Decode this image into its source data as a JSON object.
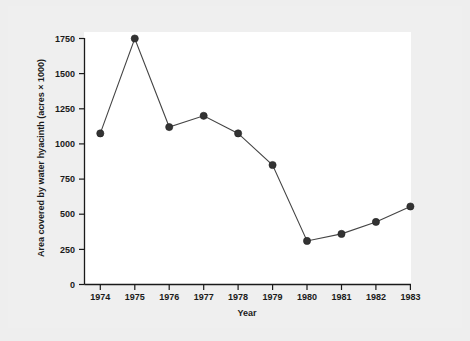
{
  "chart_data": {
    "type": "line",
    "title": "",
    "subtitle": "",
    "xlabel": "Year",
    "ylabel": "Area covered by water hyacinth (acres × 1000)",
    "categories": [
      "1974",
      "1975",
      "1976",
      "1977",
      "1978",
      "1979",
      "1980",
      "1981",
      "1982",
      "1983"
    ],
    "x": [
      1974,
      1975,
      1976,
      1977,
      1978,
      1979,
      1980,
      1981,
      1982,
      1983
    ],
    "values": [
      1075,
      1750,
      1120,
      1200,
      1075,
      850,
      310,
      360,
      445,
      555
    ],
    "series": [
      {
        "name": "Area covered by water hyacinth",
        "values": [
          1075,
          1750,
          1120,
          1200,
          1075,
          850,
          310,
          360,
          445,
          555
        ]
      }
    ],
    "xlim": [
      1973.5,
      1983.5
    ],
    "ylim": [
      0,
      1750
    ],
    "ytick_values": [
      0,
      250,
      500,
      750,
      1000,
      1250,
      1500,
      1750
    ],
    "ytick_labels": [
      "0",
      "250",
      "500",
      "750",
      "1000",
      "1250",
      "1500",
      "1750"
    ],
    "xtick_labels": [
      "1974",
      "1975",
      "1976",
      "1977",
      "1978",
      "1979",
      "1980",
      "1981",
      "1982",
      "1983"
    ],
    "grid": false,
    "legend": false,
    "legend_position": "none",
    "marker": "filled-circle",
    "colors": {
      "line": "#444444",
      "marker": "#333333",
      "axis": "#1a1a1a",
      "plot_background": "#ffffff",
      "page_background": "#efefef"
    }
  },
  "axis": {
    "x_title": "Year",
    "y_title": "Area covered by water hyacinth (acres × 1000)"
  },
  "y_ticks": [
    {
      "label": "1750"
    },
    {
      "label": "1500"
    },
    {
      "label": "1250"
    },
    {
      "label": "1000"
    },
    {
      "label": "750"
    },
    {
      "label": "500"
    },
    {
      "label": "250"
    },
    {
      "label": "0"
    }
  ],
  "x_ticks": [
    {
      "label": "1974"
    },
    {
      "label": "1975"
    },
    {
      "label": "1976"
    },
    {
      "label": "1977"
    },
    {
      "label": "1978"
    },
    {
      "label": "1979"
    },
    {
      "label": "1980"
    },
    {
      "label": "1981"
    },
    {
      "label": "1982"
    },
    {
      "label": "1983"
    }
  ]
}
